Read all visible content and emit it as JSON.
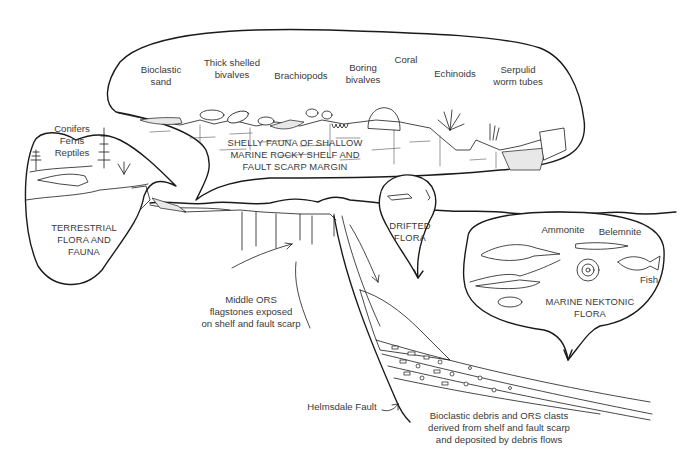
{
  "diagram": {
    "type": "geological-palaeoenvironment-cross-section",
    "colors": {
      "ink": "#1a1a1a",
      "text": "#3a3a3a",
      "background": "#ffffff"
    },
    "shelf_bubble": {
      "title": "SHELLY FAUNA OF SHALLOW\nMARINE ROCKY SHELF AND\nFAULT SCARP MARGIN",
      "items": [
        {
          "label": "Bioclastic\nsand"
        },
        {
          "label": "Thick shelled\nbivalves"
        },
        {
          "label": "Brachiopods"
        },
        {
          "label": "Boring\nbivalves"
        },
        {
          "label": "Coral"
        },
        {
          "label": "Echinoids"
        },
        {
          "label": "Serpulid\nworm tubes"
        }
      ]
    },
    "terrestrial_bubble": {
      "items_label": "Conifers\nFerns\nReptiles",
      "title": "TERRESTRIAL\nFLORA AND\nFAUNA"
    },
    "drifted_bubble": {
      "title": "DRIFTED\nFLORA"
    },
    "marine_bubble": {
      "items": [
        {
          "label": "Ammonite"
        },
        {
          "label": "Belemnite"
        },
        {
          "label": "Fish"
        }
      ],
      "title": "MARINE NEKTONIC\nFLORA"
    },
    "annotations": {
      "middle_ors": "Middle ORS\nflagstones exposed\non shelf and fault scarp",
      "fault": "Helmsdale Fault",
      "debris": "Bioclastic debris and ORS clasts\nderived from shelf and fault scarp\nand deposited by debris flows"
    }
  }
}
